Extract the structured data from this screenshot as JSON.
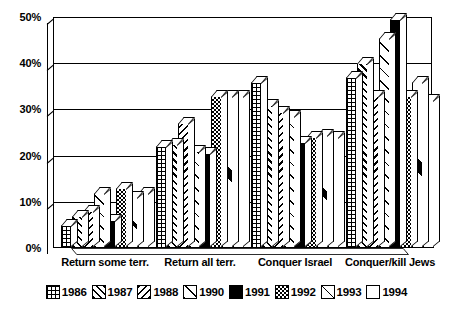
{
  "chart_data": {
    "type": "bar",
    "title": "",
    "xlabel": "",
    "ylabel": "",
    "ylim": [
      0,
      50
    ],
    "grid": true,
    "legend_position": "bottom",
    "categories": [
      "Return some terr.",
      "Return all terr.",
      "Conquer Israel",
      "Conquer/kill Jews"
    ],
    "ytick_labels": [
      "0%",
      "10%",
      "20%",
      "30%",
      "40%",
      "50%"
    ],
    "ytick_values": [
      0,
      10,
      20,
      30,
      40,
      50
    ],
    "series": [
      {
        "name": "1986",
        "pattern": "grid",
        "values": [
          5,
          22,
          36,
          37
        ]
      },
      {
        "name": "1987",
        "pattern": "diag-right",
        "values": [
          7,
          22.5,
          31,
          40
        ]
      },
      {
        "name": "1988",
        "pattern": "diag-left",
        "values": [
          8,
          27,
          29.5,
          33
        ]
      },
      {
        "name": "1990",
        "pattern": "diag-sparse",
        "values": [
          12,
          21,
          28.5,
          45.5
        ]
      },
      {
        "name": "1991",
        "pattern": "solid-black",
        "values": [
          6,
          20.5,
          23,
          49.5
        ]
      },
      {
        "name": "1992",
        "pattern": "checkerboard",
        "values": [
          13,
          33,
          24,
          33
        ]
      },
      {
        "name": "1993",
        "pattern": "single-slash",
        "values": [
          11,
          33,
          24.5,
          36
        ]
      },
      {
        "name": "1994",
        "pattern": "empty",
        "values": [
          12,
          33,
          24,
          32
        ]
      }
    ]
  },
  "legend": {
    "items": [
      {
        "label": "1986",
        "pattern": "grid"
      },
      {
        "label": "1987",
        "pattern": "diag-right"
      },
      {
        "label": "1988",
        "pattern": "diag-left"
      },
      {
        "label": "1990",
        "pattern": "diag-sparse"
      },
      {
        "label": "1991",
        "pattern": "solid-black"
      },
      {
        "label": "1992",
        "pattern": "checkerboard"
      },
      {
        "label": "1993",
        "pattern": "single-slash"
      },
      {
        "label": "1994",
        "pattern": "empty"
      }
    ]
  },
  "colors": {
    "ink": "#000000",
    "paper": "#ffffff"
  }
}
